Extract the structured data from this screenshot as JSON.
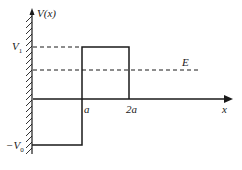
{
  "diagram": {
    "axes": {
      "y_label": "V(x)",
      "x_label": "x"
    },
    "levels": {
      "v1_label": "V",
      "v1_sub": "1",
      "e_label": "E",
      "v0_label": "−V",
      "v0_sub": "0"
    },
    "x_ticks": {
      "a_label": "a",
      "two_a_label": "2a"
    },
    "colors": {
      "line": "#1a1a1a",
      "hatch": "#333333"
    }
  }
}
